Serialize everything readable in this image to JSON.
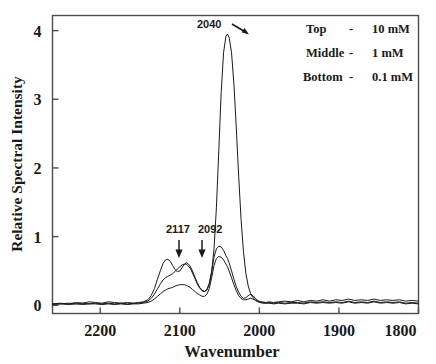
{
  "figure": {
    "background_color": "#ffffff",
    "frame_color": "#4d4d4d",
    "trace_color": "#1a1a1a",
    "text_color": "#1a1a1a"
  },
  "chart_data": {
    "type": "line",
    "title": "",
    "xlabel": "Wavenumber",
    "ylabel": "Relative Spectral Intensity",
    "xlim": [
      2260,
      1800
    ],
    "ylim": [
      -0.12,
      4.22
    ],
    "x_ticks": [
      2200,
      2100,
      2000,
      1900,
      1800
    ],
    "x_tick_labels": [
      "2200",
      "2100",
      "2000",
      "1900",
      "1800"
    ],
    "y_ticks": [
      0,
      1,
      2,
      3,
      4
    ],
    "y_tick_labels": [
      "0",
      "1",
      "2",
      "3",
      "4"
    ],
    "grid": false,
    "x_axis_reversed": true,
    "legend_position": "top-right",
    "annotations": [
      {
        "label": "2040",
        "x": 2040,
        "y": 3.95,
        "arrow": "diagonal-down-right"
      },
      {
        "label": "2117",
        "x": 2117,
        "y": 0.67,
        "arrow": "down"
      },
      {
        "label": "2092",
        "x": 2092,
        "y": 0.62,
        "arrow": "down"
      }
    ],
    "series": [
      {
        "name": "Top - 10 mM",
        "concentration": "10 mM",
        "x": [
          2260,
          2250,
          2240,
          2230,
          2222,
          2214,
          2206,
          2198,
          2190,
          2182,
          2174,
          2166,
          2158,
          2152,
          2146,
          2140,
          2136,
          2132,
          2128,
          2124,
          2121,
          2118,
          2115,
          2112,
          2109,
          2106,
          2103,
          2100,
          2097,
          2094,
          2092,
          2090,
          2087,
          2084,
          2081,
          2078,
          2075,
          2072,
          2069,
          2066,
          2063,
          2060,
          2057,
          2054,
          2051,
          2048,
          2045,
          2042,
          2040,
          2038,
          2035,
          2032,
          2029,
          2026,
          2023,
          2020,
          2017,
          2014,
          2011,
          2008,
          2005,
          2002,
          1999,
          1996,
          1992,
          1988,
          1982,
          1976,
          1968,
          1960,
          1952,
          1944,
          1936,
          1928,
          1920,
          1912,
          1904,
          1896,
          1888,
          1880,
          1872,
          1864,
          1856,
          1848,
          1840,
          1832,
          1824,
          1816,
          1808,
          1800
        ],
        "y": [
          0.02,
          0.03,
          0.02,
          0.04,
          0.03,
          0.05,
          0.04,
          0.03,
          0.05,
          0.04,
          0.03,
          0.04,
          0.03,
          0.04,
          0.05,
          0.08,
          0.14,
          0.24,
          0.38,
          0.52,
          0.61,
          0.66,
          0.67,
          0.64,
          0.58,
          0.52,
          0.49,
          0.5,
          0.55,
          0.6,
          0.62,
          0.61,
          0.57,
          0.5,
          0.41,
          0.33,
          0.26,
          0.22,
          0.2,
          0.22,
          0.3,
          0.48,
          0.82,
          1.42,
          2.25,
          3.1,
          3.68,
          3.92,
          3.95,
          3.9,
          3.68,
          3.22,
          2.58,
          1.88,
          1.25,
          0.78,
          0.47,
          0.28,
          0.17,
          0.11,
          0.08,
          0.06,
          0.05,
          0.05,
          0.04,
          0.05,
          0.04,
          0.05,
          0.06,
          0.05,
          0.07,
          0.05,
          0.07,
          0.06,
          0.08,
          0.06,
          0.08,
          0.07,
          0.09,
          0.07,
          0.08,
          0.07,
          0.09,
          0.07,
          0.08,
          0.07,
          0.08,
          0.06,
          0.07,
          0.06
        ]
      },
      {
        "name": "Middle - 1 mM",
        "concentration": "1 mM",
        "x": [
          2260,
          2250,
          2240,
          2230,
          2222,
          2214,
          2206,
          2198,
          2190,
          2182,
          2174,
          2166,
          2158,
          2152,
          2146,
          2140,
          2136,
          2132,
          2128,
          2124,
          2121,
          2118,
          2115,
          2112,
          2109,
          2106,
          2103,
          2100,
          2097,
          2094,
          2092,
          2090,
          2087,
          2084,
          2081,
          2078,
          2075,
          2072,
          2069,
          2066,
          2063,
          2060,
          2057,
          2054,
          2051,
          2048,
          2045,
          2042,
          2040,
          2038,
          2035,
          2032,
          2029,
          2026,
          2023,
          2020,
          2017,
          2014,
          2011,
          2008,
          2005,
          2002,
          1999,
          1996,
          1992,
          1988,
          1982,
          1976,
          1968,
          1960,
          1952,
          1944,
          1936,
          1928,
          1920,
          1912,
          1904,
          1896,
          1888,
          1880,
          1872,
          1864,
          1856,
          1848,
          1840,
          1832,
          1824,
          1816,
          1808,
          1800
        ],
        "y": [
          0.02,
          0.02,
          0.03,
          0.02,
          0.03,
          0.02,
          0.03,
          0.02,
          0.03,
          0.02,
          0.03,
          0.02,
          0.03,
          0.03,
          0.04,
          0.06,
          0.1,
          0.16,
          0.24,
          0.32,
          0.37,
          0.4,
          0.42,
          0.44,
          0.46,
          0.49,
          0.53,
          0.56,
          0.59,
          0.6,
          0.6,
          0.58,
          0.54,
          0.47,
          0.39,
          0.31,
          0.25,
          0.21,
          0.2,
          0.23,
          0.32,
          0.49,
          0.7,
          0.82,
          0.86,
          0.85,
          0.8,
          0.72,
          0.68,
          0.62,
          0.5,
          0.38,
          0.27,
          0.19,
          0.13,
          0.1,
          0.11,
          0.14,
          0.16,
          0.14,
          0.1,
          0.07,
          0.05,
          0.04,
          0.03,
          0.04,
          0.03,
          0.04,
          0.03,
          0.04,
          0.04,
          0.03,
          0.05,
          0.04,
          0.05,
          0.04,
          0.05,
          0.04,
          0.06,
          0.04,
          0.05,
          0.04,
          0.06,
          0.04,
          0.05,
          0.04,
          0.05,
          0.03,
          0.04,
          0.03
        ]
      },
      {
        "name": "Bottom - 0.1 mM",
        "concentration": "0.1 mM",
        "x": [
          2260,
          2250,
          2240,
          2230,
          2222,
          2214,
          2206,
          2198,
          2190,
          2182,
          2174,
          2166,
          2158,
          2152,
          2146,
          2140,
          2136,
          2132,
          2128,
          2124,
          2121,
          2118,
          2115,
          2112,
          2109,
          2106,
          2103,
          2100,
          2097,
          2094,
          2092,
          2090,
          2087,
          2084,
          2081,
          2078,
          2075,
          2072,
          2069,
          2066,
          2063,
          2060,
          2057,
          2054,
          2051,
          2048,
          2045,
          2042,
          2040,
          2038,
          2035,
          2032,
          2029,
          2026,
          2023,
          2020,
          2017,
          2014,
          2011,
          2008,
          2005,
          2002,
          1999,
          1996,
          1992,
          1988,
          1982,
          1976,
          1968,
          1960,
          1952,
          1944,
          1936,
          1928,
          1920,
          1912,
          1904,
          1896,
          1888,
          1880,
          1872,
          1864,
          1856,
          1848,
          1840,
          1832,
          1824,
          1816,
          1808,
          1800
        ],
        "y": [
          0.01,
          0.02,
          0.01,
          0.02,
          0.01,
          0.02,
          0.02,
          0.01,
          0.02,
          0.01,
          0.02,
          0.01,
          0.02,
          0.02,
          0.03,
          0.04,
          0.06,
          0.09,
          0.13,
          0.17,
          0.2,
          0.22,
          0.24,
          0.25,
          0.26,
          0.28,
          0.29,
          0.3,
          0.3,
          0.3,
          0.29,
          0.28,
          0.26,
          0.23,
          0.2,
          0.17,
          0.15,
          0.13,
          0.13,
          0.16,
          0.24,
          0.4,
          0.58,
          0.68,
          0.71,
          0.7,
          0.66,
          0.6,
          0.56,
          0.5,
          0.4,
          0.3,
          0.21,
          0.14,
          0.1,
          0.08,
          0.08,
          0.09,
          0.1,
          0.09,
          0.07,
          0.05,
          0.04,
          0.03,
          0.03,
          0.03,
          0.02,
          0.03,
          0.02,
          0.03,
          0.03,
          0.02,
          0.04,
          0.03,
          0.04,
          0.03,
          0.04,
          0.03,
          0.05,
          0.03,
          0.04,
          0.03,
          0.05,
          0.03,
          0.04,
          0.03,
          0.04,
          0.02,
          0.03,
          0.02
        ]
      }
    ]
  },
  "legend": {
    "rows": [
      {
        "position_label": "Top",
        "separator": "-",
        "value": "10 mM"
      },
      {
        "position_label": "Middle",
        "separator": "-",
        "value": "1 mM"
      },
      {
        "position_label": "Bottom",
        "separator": "-",
        "value": "0.1 mM"
      }
    ]
  }
}
